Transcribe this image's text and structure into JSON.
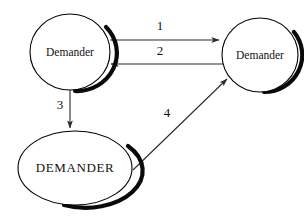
{
  "diagram": {
    "type": "node-edge-diagram",
    "background_color": "#ffffff",
    "stroke_color": "#000000",
    "edge_color": "#2b2b2b",
    "nodes": [
      {
        "id": "demander-top-left",
        "label": "Demander",
        "shape": "circle",
        "cx": 70,
        "cy": 52,
        "rx": 40,
        "ry": 38,
        "label_style": "titlecase"
      },
      {
        "id": "demander-top-right",
        "label": "Demander",
        "shape": "circle",
        "cx": 260,
        "cy": 55,
        "rx": 38,
        "ry": 37,
        "label_style": "titlecase"
      },
      {
        "id": "demander-bottom",
        "label": "DEMANDER",
        "shape": "ellipse",
        "cx": 75,
        "cy": 168,
        "rx": 57,
        "ry": 37,
        "label_style": "uppercase"
      }
    ],
    "edges": [
      {
        "id": "edge-1",
        "label": "1",
        "from": "demander-top-left",
        "to": "demander-top-right",
        "direction": "right",
        "label_x": 160,
        "label_y": 27,
        "x1": 110,
        "y1": 40,
        "x2": 221,
        "y2": 40
      },
      {
        "id": "edge-2",
        "label": "2",
        "from": "demander-top-right",
        "to": "demander-top-left",
        "direction": "left",
        "label_x": 160,
        "label_y": 52,
        "x1": 226,
        "y1": 64,
        "x2": 109,
        "y2": 64
      },
      {
        "id": "edge-3",
        "label": "3",
        "from": "demander-top-left",
        "to": "demander-bottom",
        "direction": "down",
        "label_x": 60,
        "label_y": 106,
        "x1": 70,
        "y1": 90,
        "x2": 70,
        "y2": 130
      },
      {
        "id": "edge-4",
        "label": "4",
        "from": "demander-bottom",
        "to": "demander-top-right",
        "direction": "up-right",
        "label_x": 167,
        "label_y": 114,
        "x1": 133,
        "y1": 170,
        "x2": 228,
        "y2": 78
      }
    ]
  }
}
